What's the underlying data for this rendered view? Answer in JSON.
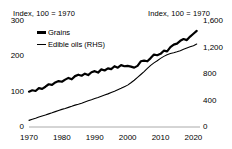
{
  "chart_data": {
    "type": "line",
    "title": "",
    "left_axis_title": "Index, 100 = 1970",
    "right_axis_title": "Index, 100 = 1970",
    "xlabel": "",
    "ylabel": "",
    "grid": false,
    "legend_position": "top-left",
    "xlim": [
      1970,
      2022
    ],
    "ylim_left": [
      0,
      300
    ],
    "ylim_right": [
      0,
      1600
    ],
    "xticks": [
      "1970",
      "1980",
      "1990",
      "2000",
      "2010",
      "2020"
    ],
    "xtick_values": [
      1970,
      1980,
      1990,
      2000,
      2010,
      2020
    ],
    "yticks_left": [
      "0",
      "100",
      "200",
      "300"
    ],
    "ytick_values_left": [
      0,
      100,
      200,
      300
    ],
    "yticks_right": [
      "0",
      "400",
      "800",
      "1,200",
      "1,600"
    ],
    "ytick_values_right": [
      0,
      400,
      800,
      1200,
      1600
    ],
    "x": [
      1970,
      1971,
      1972,
      1973,
      1974,
      1975,
      1976,
      1977,
      1978,
      1979,
      1980,
      1981,
      1982,
      1983,
      1984,
      1985,
      1986,
      1987,
      1988,
      1989,
      1990,
      1991,
      1992,
      1993,
      1994,
      1995,
      1996,
      1997,
      1998,
      1999,
      2000,
      2001,
      2002,
      2003,
      2004,
      2005,
      2006,
      2007,
      2008,
      2009,
      2010,
      2011,
      2012,
      2013,
      2014,
      2015,
      2016,
      2017,
      2018,
      2019,
      2020,
      2021
    ],
    "series": [
      {
        "name": "Grains",
        "axis": "left",
        "color": "#000000",
        "width": 2.2,
        "values": [
          100,
          104,
          102,
          110,
          108,
          114,
          121,
          119,
          126,
          130,
          128,
          134,
          139,
          135,
          144,
          148,
          145,
          151,
          147,
          155,
          158,
          154,
          163,
          160,
          166,
          164,
          172,
          168,
          175,
          172,
          173,
          171,
          168,
          173,
          186,
          188,
          186,
          195,
          205,
          203,
          207,
          216,
          214,
          226,
          233,
          236,
          244,
          249,
          246,
          256,
          264,
          272
        ]
      },
      {
        "name": "Edible oils (RHS)",
        "axis": "right",
        "color": "#000000",
        "width": 1.1,
        "values": [
          100,
          118,
          132,
          150,
          166,
          180,
          198,
          214,
          232,
          250,
          266,
          280,
          296,
          312,
          330,
          344,
          360,
          378,
          396,
          412,
          430,
          446,
          464,
          482,
          500,
          520,
          540,
          562,
          584,
          608,
          632,
          668,
          706,
          748,
          792,
          836,
          884,
          930,
          968,
          1000,
          1036,
          1066,
          1092,
          1110,
          1122,
          1136,
          1152,
          1174,
          1192,
          1210,
          1228,
          1252
        ]
      }
    ]
  }
}
